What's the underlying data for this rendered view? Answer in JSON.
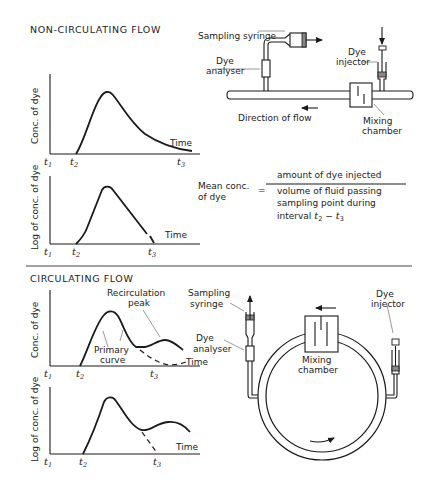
{
  "sections": {
    "non_circulating": {
      "title": "NON-CIRCULATING FLOW",
      "graph_linear": {
        "ylabel": "Conc. of dye",
        "xlabel": "Time",
        "ticks": [
          "t1",
          "t2",
          "t3"
        ]
      },
      "graph_log": {
        "ylabel": "Log of conc. of dye",
        "xlabel": "Time",
        "ticks": [
          "t1",
          "t2",
          "t3"
        ]
      },
      "apparatus": {
        "sampling_syringe": "Sampling syringe",
        "dye_analyser_1": "Dye",
        "dye_analyser_2": "analyser",
        "dye_injector_1": "Dye",
        "dye_injector_2": "injector",
        "direction": "Direction of flow",
        "mixing_chamber_1": "Mixing",
        "mixing_chamber_2": "chamber"
      },
      "formula": {
        "lhs_1": "Mean conc.",
        "lhs_2": "of dye",
        "equals": "=",
        "numerator": "amount of dye injected",
        "denominator_1": "volume of fluid passing",
        "denominator_2": "sampling point during",
        "denominator_3": "interval t2 − t3"
      }
    },
    "circulating": {
      "title": "CIRCULATING FLOW",
      "graph_linear": {
        "ylabel": "Conc. of dye",
        "xlabel": "Time",
        "ticks": [
          "t1",
          "t2",
          "t3"
        ],
        "recirc_1": "Recirculation",
        "recirc_2": "peak",
        "primary_1": "Primary",
        "primary_2": "curve"
      },
      "graph_log": {
        "ylabel": "Log of conc. of dye",
        "xlabel": "Time",
        "ticks": [
          "t1",
          "t2",
          "t3"
        ]
      },
      "apparatus": {
        "sampling_1": "Sampling",
        "sampling_2": "syringe",
        "dye_analyser_1": "Dye",
        "dye_analyser_2": "analyser",
        "dye_injector_1": "Dye",
        "dye_injector_2": "injector",
        "mixing_chamber_1": "Mixing",
        "mixing_chamber_2": "chamber"
      }
    }
  }
}
